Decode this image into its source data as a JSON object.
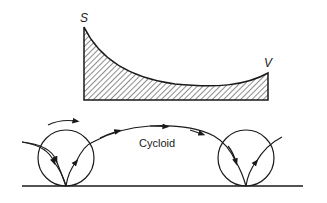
{
  "diagram": {
    "type": "flow-diagram",
    "upper_profile": {
      "start_label": "S",
      "end_label": "V",
      "fill": "hatched",
      "description": "Hatched area under a decaying curve from S (high, left) down to a minimum and rising slightly to V (right)"
    },
    "lower_path": {
      "label": "Cycloid",
      "circles": 2,
      "description": "Arrowed cycloid arc between two circles resting on a baseline, with rotation arrow over left circle"
    },
    "colors": {
      "stroke": "#1a1a1a",
      "background": "#ffffff"
    }
  }
}
